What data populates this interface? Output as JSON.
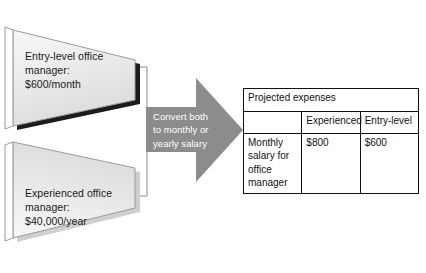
{
  "diagram": {
    "shapes": [
      {
        "id": "entry-level-shape",
        "name": "entry-level-office-manager-callout",
        "lines": [
          "Entry-level office",
          "manager:",
          "$600/month"
        ],
        "fill": "#e9e9e9",
        "shadow": "#1c1c1c"
      },
      {
        "id": "experienced-shape",
        "name": "experienced-office-manager-callout",
        "lines": [
          "Experienced office",
          "manager:",
          "$40,000/year"
        ],
        "fill": "#e9e9e9",
        "shadow": "#c9c9c9"
      }
    ],
    "arrow": {
      "name": "convert-arrow",
      "lines": [
        "Convert both",
        "to monthly or",
        "yearly salary"
      ],
      "fill": "#8c8c8c",
      "text_color": "#ffffff"
    }
  },
  "table": {
    "name": "projected-expenses-table",
    "title": "Projected expenses",
    "columns": [
      "",
      "Experienced",
      "Entry-level"
    ],
    "rows": [
      {
        "label": "Monthly salary\nfor office\nmanager",
        "experienced": "$800",
        "entry_level": "$600"
      }
    ]
  },
  "colors": {
    "shape_fill": "#e9e9e9",
    "arrow_fill": "#8c8c8c",
    "outline": "#7a7a7a",
    "table_border": "#111111",
    "text": "#1a1a1a"
  }
}
